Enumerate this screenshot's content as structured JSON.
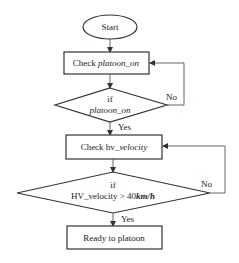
{
  "diagram": {
    "type": "flowchart",
    "nodes": {
      "start": {
        "label": "Start",
        "shape": "oval"
      },
      "check_platoon": {
        "label_prefix": "Check ",
        "label_var": "platoon_on",
        "shape": "rectangle"
      },
      "if_platoon": {
        "label_line1": "if",
        "label_line2": "platoon_on",
        "shape": "diamond"
      },
      "check_hv": {
        "label_prefix": "Check hv",
        "label_var": "_velocity",
        "shape": "rectangle"
      },
      "if_hv": {
        "label_line1": "if",
        "label_line2_prefix": "HV_velocity > 40",
        "label_line2_unit": "km/h",
        "shape": "diamond"
      },
      "ready": {
        "label": "Ready to platoon",
        "shape": "rectangle"
      }
    },
    "edges": {
      "yes_label": "Yes",
      "no_label": "No"
    }
  }
}
